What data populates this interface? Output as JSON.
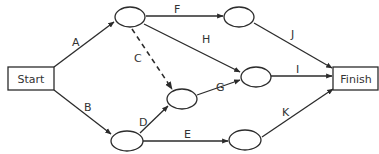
{
  "diagram": {
    "type": "activity-on-arrow network",
    "terminals": {
      "start": {
        "label": "Start"
      },
      "finish": {
        "label": "Finish"
      }
    },
    "nodes": [
      {
        "id": "n1",
        "label": ""
      },
      {
        "id": "n2",
        "label": ""
      },
      {
        "id": "n3",
        "label": ""
      },
      {
        "id": "n4",
        "label": ""
      },
      {
        "id": "n5",
        "label": ""
      },
      {
        "id": "n6",
        "label": ""
      }
    ],
    "activities": [
      {
        "label": "A",
        "from": "start",
        "to": "n1",
        "style": "solid"
      },
      {
        "label": "B",
        "from": "start",
        "to": "n5",
        "style": "solid"
      },
      {
        "label": "C",
        "from": "n1",
        "to": "n4",
        "style": "dashed"
      },
      {
        "label": "D",
        "from": "n5",
        "to": "n4",
        "style": "solid"
      },
      {
        "label": "E",
        "from": "n5",
        "to": "n6",
        "style": "solid"
      },
      {
        "label": "F",
        "from": "n1",
        "to": "n2",
        "style": "solid"
      },
      {
        "label": "G",
        "from": "n4",
        "to": "n3",
        "style": "solid"
      },
      {
        "label": "H",
        "from": "n1",
        "to": "n3",
        "style": "solid"
      },
      {
        "label": "I",
        "from": "n3",
        "to": "finish",
        "style": "solid"
      },
      {
        "label": "J",
        "from": "n2",
        "to": "finish",
        "style": "solid"
      },
      {
        "label": "K",
        "from": "n6",
        "to": "finish",
        "style": "solid"
      }
    ]
  },
  "labels": {
    "A": "A",
    "B": "B",
    "C": "C",
    "D": "D",
    "E": "E",
    "F": "F",
    "G": "G",
    "H": "H",
    "I": "I",
    "J": "J",
    "K": "K"
  },
  "colors": {
    "line": "#2b2b2b",
    "text": "#333333",
    "background": "#ffffff"
  }
}
